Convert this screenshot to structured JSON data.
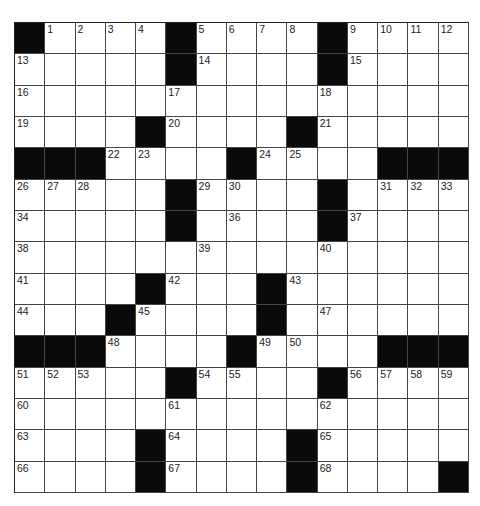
{
  "puzzle": {
    "rows": 15,
    "cols": 15,
    "colors": {
      "block": "#0a0a0a",
      "cell": "#ffffff",
      "line": "#444444"
    },
    "layout": [
      "#....#....#....",
      ".....#....#....",
      "...............",
      "....#....#.....",
      "###....#....###",
      ".....#....#....",
      ".....#....#....",
      "...............",
      "....#...#......",
      "...#....#......",
      "###....#....###",
      ".....#....#....",
      "...............",
      "....#....#.....",
      "....#....#....#"
    ],
    "numbers": [
      {
        "r": 0,
        "c": 1,
        "n": "1"
      },
      {
        "r": 0,
        "c": 2,
        "n": "2"
      },
      {
        "r": 0,
        "c": 3,
        "n": "3"
      },
      {
        "r": 0,
        "c": 4,
        "n": "4"
      },
      {
        "r": 0,
        "c": 6,
        "n": "5"
      },
      {
        "r": 0,
        "c": 7,
        "n": "6"
      },
      {
        "r": 0,
        "c": 8,
        "n": "7"
      },
      {
        "r": 0,
        "c": 9,
        "n": "8"
      },
      {
        "r": 0,
        "c": 11,
        "n": "9"
      },
      {
        "r": 0,
        "c": 12,
        "n": "10"
      },
      {
        "r": 0,
        "c": 13,
        "n": "11"
      },
      {
        "r": 0,
        "c": 14,
        "n": "12"
      },
      {
        "r": 1,
        "c": 0,
        "n": "13"
      },
      {
        "r": 1,
        "c": 6,
        "n": "14"
      },
      {
        "r": 1,
        "c": 11,
        "n": "15"
      },
      {
        "r": 2,
        "c": 0,
        "n": "16"
      },
      {
        "r": 2,
        "c": 5,
        "n": "17"
      },
      {
        "r": 2,
        "c": 10,
        "n": "18"
      },
      {
        "r": 3,
        "c": 0,
        "n": "19"
      },
      {
        "r": 3,
        "c": 5,
        "n": "20"
      },
      {
        "r": 3,
        "c": 10,
        "n": "21"
      },
      {
        "r": 4,
        "c": 3,
        "n": "22"
      },
      {
        "r": 4,
        "c": 4,
        "n": "23"
      },
      {
        "r": 4,
        "c": 8,
        "n": "24"
      },
      {
        "r": 4,
        "c": 9,
        "n": "25"
      },
      {
        "r": 5,
        "c": 0,
        "n": "26"
      },
      {
        "r": 5,
        "c": 1,
        "n": "27"
      },
      {
        "r": 5,
        "c": 2,
        "n": "28"
      },
      {
        "r": 5,
        "c": 6,
        "n": "29"
      },
      {
        "r": 5,
        "c": 7,
        "n": "30"
      },
      {
        "r": 5,
        "c": 12,
        "n": "31"
      },
      {
        "r": 5,
        "c": 13,
        "n": "32"
      },
      {
        "r": 5,
        "c": 14,
        "n": "33"
      },
      {
        "r": 6,
        "c": 0,
        "n": "34"
      },
      {
        "r": 6,
        "c": 5,
        "n": "35"
      },
      {
        "r": 6,
        "c": 7,
        "n": "36"
      },
      {
        "r": 6,
        "c": 11,
        "n": "37"
      },
      {
        "r": 7,
        "c": 0,
        "n": "38"
      },
      {
        "r": 7,
        "c": 6,
        "n": "39"
      },
      {
        "r": 7,
        "c": 10,
        "n": "40"
      },
      {
        "r": 8,
        "c": 0,
        "n": "41"
      },
      {
        "r": 8,
        "c": 5,
        "n": "42"
      },
      {
        "r": 8,
        "c": 9,
        "n": "43"
      },
      {
        "r": 9,
        "c": 0,
        "n": "44"
      },
      {
        "r": 9,
        "c": 4,
        "n": "45"
      },
      {
        "r": 9,
        "c": 8,
        "n": "46"
      },
      {
        "r": 9,
        "c": 10,
        "n": "47"
      },
      {
        "r": 10,
        "c": 3,
        "n": "48"
      },
      {
        "r": 10,
        "c": 8,
        "n": "49"
      },
      {
        "r": 10,
        "c": 9,
        "n": "50"
      },
      {
        "r": 11,
        "c": 0,
        "n": "51"
      },
      {
        "r": 11,
        "c": 1,
        "n": "52"
      },
      {
        "r": 11,
        "c": 2,
        "n": "53"
      },
      {
        "r": 11,
        "c": 6,
        "n": "54"
      },
      {
        "r": 11,
        "c": 7,
        "n": "55"
      },
      {
        "r": 11,
        "c": 11,
        "n": "56"
      },
      {
        "r": 11,
        "c": 12,
        "n": "57"
      },
      {
        "r": 11,
        "c": 13,
        "n": "58"
      },
      {
        "r": 11,
        "c": 14,
        "n": "59"
      },
      {
        "r": 12,
        "c": 0,
        "n": "60"
      },
      {
        "r": 12,
        "c": 5,
        "n": "61"
      },
      {
        "r": 12,
        "c": 10,
        "n": "62"
      },
      {
        "r": 13,
        "c": 0,
        "n": "63"
      },
      {
        "r": 13,
        "c": 5,
        "n": "64"
      },
      {
        "r": 13,
        "c": 10,
        "n": "65"
      },
      {
        "r": 14,
        "c": 0,
        "n": "66"
      },
      {
        "r": 14,
        "c": 5,
        "n": "67"
      },
      {
        "r": 14,
        "c": 10,
        "n": "68"
      }
    ]
  }
}
